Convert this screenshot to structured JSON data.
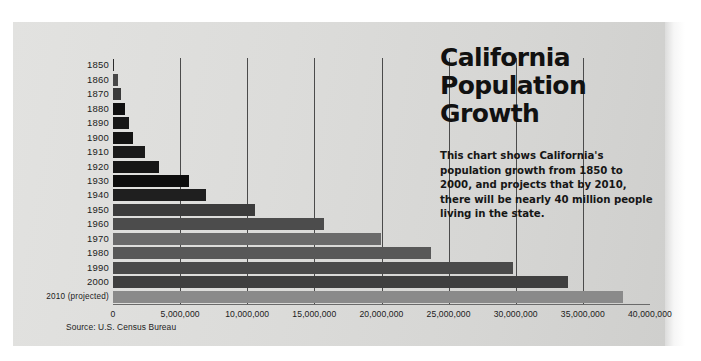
{
  "title_lines": [
    "California",
    "Population",
    "Growth"
  ],
  "blurb": "This chart shows California's population growth from 1850 to 2000, and projects that by 2010, there will be nearly 40 million people living in the state.",
  "source": "Source: U.S. Census Bureau",
  "colors": {
    "panel_bg": "#dcdcda",
    "gridline": "#4b4b4b",
    "text": "#1b1b1b"
  },
  "chart_data": {
    "type": "bar",
    "orientation": "horizontal",
    "xlabel": "",
    "ylabel": "",
    "xlim": [
      0,
      40000000
    ],
    "grid": true,
    "legend": false,
    "source": "Source: U.S. Census Bureau",
    "xticks": [
      0,
      5000000,
      10000000,
      15000000,
      20000000,
      25000000,
      30000000,
      35000000,
      40000000
    ],
    "xticklabels": [
      "0",
      "5,000,000",
      "10,000,000",
      "15,000,000",
      "20,000,000",
      "25,000,000",
      "30,000,000",
      "35,000,000",
      "40,000,000"
    ],
    "categories": [
      "1850",
      "1860",
      "1870",
      "1880",
      "1890",
      "1900",
      "1910",
      "1920",
      "1930",
      "1940",
      "1950",
      "1960",
      "1970",
      "1980",
      "1990",
      "2000",
      "2010 (projected)"
    ],
    "values": [
      92597,
      379994,
      560247,
      864694,
      1213398,
      1485053,
      2377549,
      3426861,
      5677251,
      6907387,
      10586223,
      15717204,
      19953134,
      23667902,
      29760021,
      33871648,
      38000000
    ],
    "bar_colors": [
      "#2c2c2c",
      "#484848",
      "#3a3a3a",
      "#101010",
      "#171717",
      "#131313",
      "#1a1a1a",
      "#161616",
      "#0d0d0d",
      "#1f1f1f",
      "#3c3c3c",
      "#4c4c4c",
      "#6a6a6a",
      "#585858",
      "#4a4a4a",
      "#3f3f3f",
      "#8a8a8a"
    ]
  }
}
